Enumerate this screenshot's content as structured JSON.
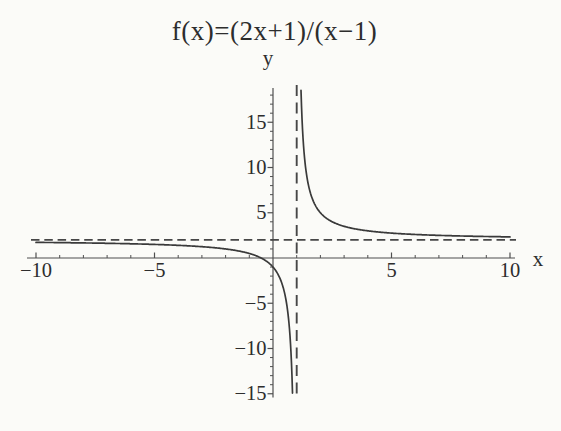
{
  "figure": {
    "title": "f(x)=(2x+1)/(x−1)"
  },
  "chart_data": {
    "type": "line",
    "title": "f(x)=(2x+1)/(x−1)",
    "function": {
      "expression": "f(x)=(2x+1)/(x-1)",
      "numerator_coeffs": [
        2,
        1
      ],
      "denominator_coeffs": [
        1,
        -1
      ]
    },
    "xlabel": "x",
    "ylabel": "y",
    "xlim": [
      -10,
      10
    ],
    "ylim": [
      -15,
      18
    ],
    "grid": false,
    "legend": false,
    "x_ticks": {
      "major_values": [
        -10,
        -5,
        5,
        10
      ],
      "major_labels": [
        "−10",
        "−5",
        "5",
        "10"
      ],
      "minor_step": 1
    },
    "y_ticks": {
      "major_values": [
        15,
        10,
        5,
        -5,
        -10,
        -15
      ],
      "major_labels": [
        "15",
        "10",
        "5",
        "−5",
        "−10",
        "−15"
      ],
      "minor_step": 1
    },
    "asymptotes": {
      "vertical_x": 1,
      "horizontal_y": 2,
      "line_style": "dashed"
    },
    "branches": [
      {
        "x_range": [
          -10,
          0.83
        ]
      },
      {
        "x_range": [
          1.18,
          10
        ]
      }
    ],
    "key_points": {
      "x_intercept": -0.5,
      "y_intercept": -1
    },
    "colors": {
      "curve": "#3a3a3a",
      "asymptote": "#474747",
      "axis": "#4f4f4f",
      "text": "#2d2d2d",
      "background": "#fbfbf8"
    }
  }
}
